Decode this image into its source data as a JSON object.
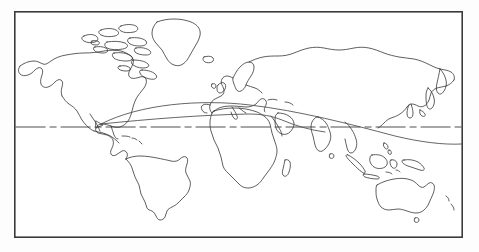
{
  "image": {
    "kind": "world-map-outline",
    "title": "World map outline",
    "description": "Black-and-white line-art world map in rectangular (equirectangular) projection with a dash-dot equator line and two long great-circle style route arcs.",
    "background_color": "#fdfdfd",
    "paper_color": "#ffffff",
    "line_color": "#2a2a2a",
    "frame_color": "#3b3b3b",
    "width": 479,
    "height": 252
  },
  "frame": {
    "name": "map-border",
    "x": 14,
    "y": 11,
    "width": 449,
    "height": 227,
    "stroke_width": 1.6
  },
  "equator": {
    "label": "",
    "y": 127,
    "style": "dash-dot",
    "color": "#3a3a3a",
    "dash_pattern": "30 4 7 4"
  },
  "routes": [
    {
      "name": "route-arc-north",
      "style": "solid",
      "color": "#4a4a4a",
      "description": "Arc from Central America across the Atlantic, peaking over the Mediterranean, continuing east past Arabia and Southeast Asia to the right map edge."
    },
    {
      "name": "route-arc-south",
      "style": "solid",
      "color": "#4a4a4a",
      "description": "Shallower arc from Central America eastward through North Africa to Arabia, merging with the northern arc."
    }
  ],
  "landmasses": [
    {
      "name": "north-america",
      "label": "North America"
    },
    {
      "name": "greenland",
      "label": "Greenland"
    },
    {
      "name": "canadian-arctic-archipelago",
      "label": "Canadian Arctic Archipelago"
    },
    {
      "name": "iceland",
      "label": "Iceland"
    },
    {
      "name": "south-america",
      "label": "South America"
    },
    {
      "name": "africa",
      "label": "Africa"
    },
    {
      "name": "madagascar",
      "label": "Madagascar"
    },
    {
      "name": "europe",
      "label": "Europe"
    },
    {
      "name": "british-isles",
      "label": "British Isles"
    },
    {
      "name": "scandinavia",
      "label": "Scandinavia"
    },
    {
      "name": "asia",
      "label": "Asia"
    },
    {
      "name": "india",
      "label": "India"
    },
    {
      "name": "sri-lanka",
      "label": "Sri Lanka"
    },
    {
      "name": "japan",
      "label": "Japan"
    },
    {
      "name": "indonesia",
      "label": "Indonesia"
    },
    {
      "name": "borneo",
      "label": "Borneo"
    },
    {
      "name": "new-guinea",
      "label": "New Guinea"
    },
    {
      "name": "australia",
      "label": "Australia"
    },
    {
      "name": "tasmania",
      "label": "Tasmania"
    },
    {
      "name": "new-zealand",
      "label": "New Zealand"
    }
  ],
  "annotations": {
    "text_labels": [],
    "legend": null,
    "scale_bar": null
  }
}
